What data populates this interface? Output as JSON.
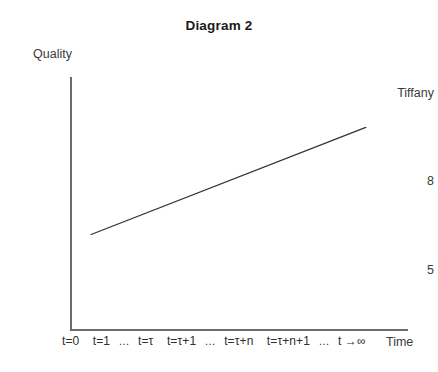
{
  "chart_data": {
    "type": "line",
    "title": "Diagram 2",
    "xlabel": "Time",
    "ylabel": "Quality",
    "grid": false,
    "legend": false,
    "yticks": [
      "Tiffany",
      "8",
      "5"
    ],
    "ytick_values": [
      10,
      8,
      5
    ],
    "ylim": [
      3,
      11
    ],
    "xtick_label_full": "t=0  t=1 … t=τ  t=τ+1 … t=τ+n  t=τ+n+1 … t →∞",
    "xticks": [
      "t=0",
      "t=1",
      "…",
      "t=τ",
      "t=τ+1",
      "…",
      "t=τ+n",
      "t=τ+n+1",
      "…",
      "t →∞"
    ],
    "series": [
      {
        "name": "quality",
        "x": [
          0.5,
          7.0
        ],
        "y": [
          6.0,
          9.4
        ],
        "points": [
          {
            "x": 0.5,
            "y": 6.0
          },
          {
            "x": 7.0,
            "y": 9.4
          }
        ],
        "color": "#333333"
      }
    ],
    "colors": {
      "line": "#333333",
      "axis": "#6b6b6b",
      "text": "#2e2e2e",
      "title": "#1a1a1a",
      "background": "#ffffff"
    }
  }
}
